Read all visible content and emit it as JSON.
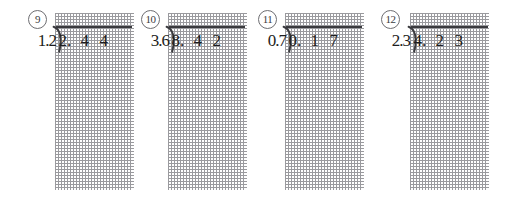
{
  "worksheet": {
    "type": "long-division-practice-grid",
    "grid": {
      "columns": 4,
      "rows": 9,
      "cell_size_px": 19.5,
      "line_style": "dotted",
      "line_color": "#9a9a9e"
    },
    "bar_color": "#3a3a3e",
    "ink_color": "#1d1d20",
    "background": "#ffffff"
  },
  "problems": [
    {
      "number": "9",
      "divisor": "1.2",
      "dividend": "2.44",
      "digits": [
        "2.",
        "4",
        "4"
      ],
      "left_px": 28,
      "grid_left_px": 55,
      "divisor_left_px": 6,
      "divisor_width_px": 22,
      "bracket_left_px": 53,
      "bar_left_px": 56,
      "bar_width_px": 76
    },
    {
      "number": "10",
      "divisor": "3.6",
      "dividend": "8.42",
      "digits": [
        "8.",
        "4",
        "2"
      ],
      "left_px": 141,
      "grid_left_px": 168,
      "divisor_left_px": 4,
      "divisor_width_px": 24,
      "bracket_left_px": 166,
      "bar_left_px": 169,
      "bar_width_px": 76
    },
    {
      "number": "11",
      "divisor": "0.7",
      "dividend": "0.17",
      "digits": [
        "0.",
        "1",
        "7"
      ],
      "left_px": 258,
      "grid_left_px": 285,
      "divisor_left_px": 4,
      "divisor_width_px": 24,
      "bracket_left_px": 283,
      "bar_left_px": 286,
      "bar_width_px": 76
    },
    {
      "number": "12",
      "divisor": "2.3",
      "dividend": "4.23",
      "digits": [
        "4.",
        "2",
        "3"
      ],
      "left_px": 381,
      "grid_left_px": 410,
      "divisor_left_px": 5,
      "divisor_width_px": 24,
      "bracket_left_px": 408,
      "bar_left_px": 411,
      "bar_width_px": 77
    }
  ]
}
